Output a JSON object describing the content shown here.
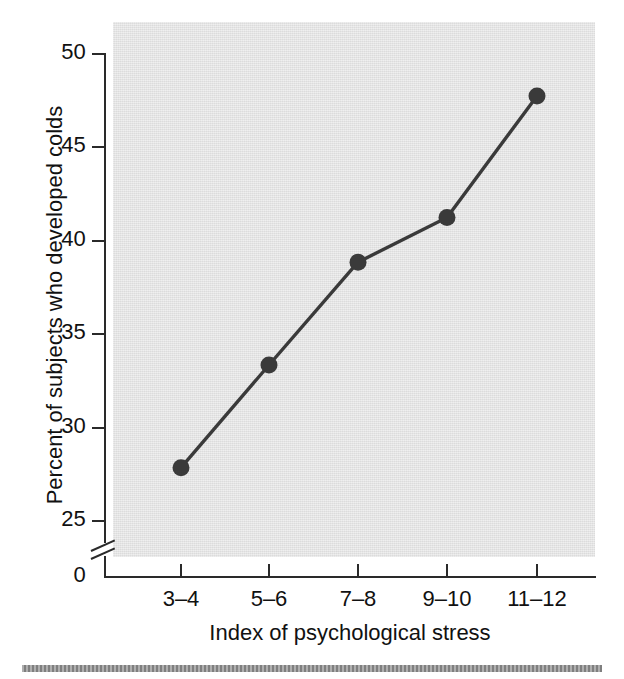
{
  "chart_data": {
    "type": "line",
    "title": "",
    "xlabel": "Index of psychological stress",
    "ylabel": "Percent of subjects who developed colds",
    "categories": [
      "3–4",
      "5–6",
      "7–8",
      "9–10",
      "11–12"
    ],
    "values": [
      27.8,
      33.3,
      38.8,
      41.2,
      47.7
    ],
    "series": [
      {
        "name": "Percent who developed colds",
        "values": [
          27.8,
          33.3,
          38.8,
          41.2,
          47.7
        ]
      }
    ],
    "ylim": [
      25,
      50
    ],
    "yticks": [
      25,
      30,
      35,
      40,
      45,
      50
    ],
    "ytick_labels": [
      "25",
      "30",
      "35",
      "40",
      "45",
      "50"
    ],
    "y_axis_break": true,
    "y_origin_label": "0",
    "xticks": [
      "3–4",
      "5–6",
      "7–8",
      "9–10",
      "11–12"
    ],
    "grid": false,
    "legend": "none",
    "marker": "circle",
    "colors": {
      "line": "#3a3a3a",
      "marker": "#3a3a3a",
      "panel_background": "#e2e2e2",
      "axis": "#2a2a2a",
      "text": "#111111",
      "bottom_rule": "#8d8d8d"
    }
  },
  "figure": {
    "y_axis_label": "Percent of subjects who developed colds",
    "x_axis_label": "Index of psychological stress",
    "y_tick_labels": [
      "50",
      "45",
      "40",
      "35",
      "30",
      "25"
    ],
    "y_zero_label": "0",
    "x_tick_labels": [
      "3–4",
      "5–6",
      "7–8",
      "9–10",
      "11–12"
    ]
  }
}
